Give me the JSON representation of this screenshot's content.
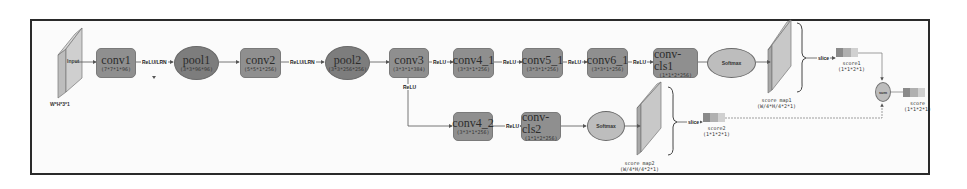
{
  "diagram": {
    "input": {
      "label": "Input",
      "dims": "W*H*3*1"
    },
    "nodes": {
      "conv1": {
        "title": "conv1",
        "dims": "(7*7*1*96)"
      },
      "pool1": {
        "title": "pool1",
        "dims": "(3*3*96*96)"
      },
      "conv2": {
        "title": "conv2",
        "dims": "(5*5*1*256)"
      },
      "pool2": {
        "title": "pool2",
        "dims": "(3*3*256*256)"
      },
      "conv3": {
        "title": "conv3",
        "dims": "(3*3*1*384)"
      },
      "conv4_1": {
        "title": "conv4_1",
        "dims": "(3*3*1*256)"
      },
      "conv5_1": {
        "title": "conv5_1",
        "dims": "(3*3*1*256)"
      },
      "conv6_1": {
        "title": "conv6_1",
        "dims": "(3*3*1*256)"
      },
      "conv_cls1": {
        "title": "conv-cls1",
        "dims": "(1*1*2*256)"
      },
      "softmax1": {
        "title": "Softmax"
      },
      "conv4_2": {
        "title": "conv4_2",
        "dims": "(3*3*1*256)"
      },
      "conv_cls2": {
        "title": "conv-cls2",
        "dims": "(1*1*2*256)"
      },
      "softmax2": {
        "title": "Softmax"
      },
      "sum": {
        "title": "sum"
      }
    },
    "edges": {
      "relu_lrn_1": "ReLU/LRN",
      "relu_lrn_2": "ReLU/LRN",
      "relu_a": "ReLU",
      "relu_b": "ReLU",
      "relu_c": "ReLU",
      "relu_branch": "ReLU",
      "relu_d": "ReLU",
      "slice1": "slice",
      "slice2": "slice"
    },
    "score_maps": {
      "map1": {
        "label": "score map1",
        "dims": "(W/4*H/4*2*1)"
      },
      "map2": {
        "label": "score map2",
        "dims": "(W/4*H/4*2*1)"
      }
    },
    "scores": {
      "score1": {
        "label": "score1",
        "dims": "(1*1*2*1)"
      },
      "score2": {
        "label": "score2",
        "dims": "(1*1*2*1)"
      },
      "score": {
        "label": "score",
        "dims": "(1*1*2*1)"
      }
    },
    "colors": {
      "box": "#8f8f8f",
      "ellipse_dark": "#7d7d7d",
      "ellipse_light": "#bdbdbd",
      "frame": "#2a2a2a",
      "plane": "#c8c8c8"
    }
  }
}
